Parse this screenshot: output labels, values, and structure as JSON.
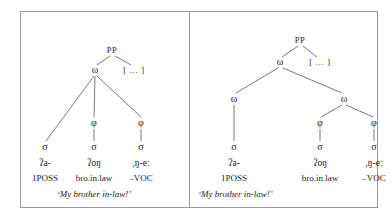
{
  "figure": {
    "caption_present": false,
    "border_color": "#9a9a9a",
    "background": "#ffffff"
  },
  "labels": {
    "pp": "PP",
    "omega": "ω",
    "phi": "φ",
    "sigma": "σ",
    "ellipsis": "[ … ]"
  },
  "panels": [
    {
      "id": "a",
      "name": "left-tree",
      "nodes": [
        {
          "name": "pp-root",
          "label": "PP",
          "x": 91,
          "y": 38
        },
        {
          "name": "omega-top",
          "label": "ω",
          "x": 74,
          "y": 58
        },
        {
          "name": "ellipsis",
          "label": "[ … ]",
          "x": 113,
          "y": 58
        },
        {
          "name": "phi-mid",
          "label": "φ",
          "x": 73,
          "y": 111
        },
        {
          "name": "phi-right",
          "label": "φ",
          "x": 120,
          "y": 111
        },
        {
          "name": "sigma-left",
          "label": "σ",
          "x": 24,
          "y": 135
        },
        {
          "name": "sigma-mid",
          "label": "σ",
          "x": 73,
          "y": 135
        },
        {
          "name": "sigma-right",
          "label": "σ",
          "x": 120,
          "y": 135
        }
      ],
      "edges": [
        {
          "name": "pp-to-omega",
          "x1": 89,
          "y1": 44,
          "x2": 76,
          "y2": 53
        },
        {
          "name": "pp-to-ellipsis",
          "x1": 94,
          "y1": 44,
          "x2": 110,
          "y2": 53
        },
        {
          "name": "omega-to-sigma-left",
          "x1": 73,
          "y1": 64,
          "x2": 25,
          "y2": 129
        },
        {
          "name": "omega-to-phi-mid",
          "x1": 74,
          "y1": 64,
          "x2": 73,
          "y2": 105
        },
        {
          "name": "omega-to-phi-right",
          "x1": 76,
          "y1": 64,
          "x2": 120,
          "y2": 105
        },
        {
          "name": "phi-mid-to-sigma",
          "x1": 73,
          "y1": 117,
          "x2": 73,
          "y2": 129
        },
        {
          "name": "phi-right-to-sigma",
          "x1": 120,
          "y1": 117,
          "x2": 120,
          "y2": 129
        }
      ],
      "glosses": [
        {
          "name": "gloss-column-1",
          "x": 24,
          "form": "ʔa-",
          "gloss": "1POSS"
        },
        {
          "name": "gloss-column-2",
          "x": 73,
          "form": "ʔoŋ",
          "gloss": "bro.in.law"
        },
        {
          "name": "gloss-column-3",
          "x": 120,
          "form": ",ŋ-eː",
          "gloss": "–VOC"
        }
      ],
      "gloss_rows": {
        "form_y": 147,
        "gloss_y": 162
      },
      "translation": {
        "name": "translation-left",
        "text": "‘My brother in-law!’",
        "x": 73,
        "y": 178,
        "align": "center"
      }
    },
    {
      "id": "b",
      "name": "right-tree",
      "nodes": [
        {
          "name": "pp-root",
          "label": "PP",
          "x": 110,
          "y": 28
        },
        {
          "name": "omega-top",
          "label": "ω",
          "x": 90,
          "y": 50
        },
        {
          "name": "ellipsis",
          "label": "[ … ]",
          "x": 130,
          "y": 50
        },
        {
          "name": "omega-left",
          "label": "ω",
          "x": 44,
          "y": 87
        },
        {
          "name": "omega-right",
          "label": "ω",
          "x": 154,
          "y": 87
        },
        {
          "name": "phi-left",
          "label": "φ",
          "x": 130,
          "y": 111
        },
        {
          "name": "phi-right",
          "label": "φ",
          "x": 184,
          "y": 111
        },
        {
          "name": "sigma-left",
          "label": "σ",
          "x": 44,
          "y": 135
        },
        {
          "name": "sigma-mid",
          "label": "σ",
          "x": 130,
          "y": 135
        },
        {
          "name": "sigma-right",
          "label": "σ",
          "x": 184,
          "y": 135
        }
      ],
      "edges": [
        {
          "name": "pp-to-omega",
          "x1": 108,
          "y1": 34,
          "x2": 92,
          "y2": 45
        },
        {
          "name": "pp-to-ellipsis",
          "x1": 113,
          "y1": 34,
          "x2": 127,
          "y2": 45
        },
        {
          "name": "omega-to-omega-left",
          "x1": 88,
          "y1": 56,
          "x2": 46,
          "y2": 81
        },
        {
          "name": "omega-to-omega-right",
          "x1": 93,
          "y1": 56,
          "x2": 152,
          "y2": 81
        },
        {
          "name": "omega-left-to-sigma",
          "x1": 44,
          "y1": 93,
          "x2": 44,
          "y2": 129
        },
        {
          "name": "omega-right-to-phi-left",
          "x1": 152,
          "y1": 93,
          "x2": 131,
          "y2": 105
        },
        {
          "name": "omega-right-to-phi-right",
          "x1": 156,
          "y1": 93,
          "x2": 183,
          "y2": 105
        },
        {
          "name": "phi-left-to-sigma",
          "x1": 130,
          "y1": 117,
          "x2": 130,
          "y2": 129
        },
        {
          "name": "phi-right-to-sigma",
          "x1": 184,
          "y1": 117,
          "x2": 184,
          "y2": 129
        }
      ],
      "glosses": [
        {
          "name": "gloss-column-1",
          "x": 44,
          "form": "ʔa-",
          "gloss": "1POSS"
        },
        {
          "name": "gloss-column-2",
          "x": 130,
          "form": "ʔoŋ",
          "gloss": "bro.in.law"
        },
        {
          "name": "gloss-column-3",
          "x": 184,
          "form": ",ŋ-eː",
          "gloss": "–VOC"
        }
      ],
      "gloss_rows": {
        "form_y": 147,
        "gloss_y": 162
      },
      "translation": {
        "name": "translation-right",
        "text": "‘My brother in-law!’",
        "x": 8,
        "y": 178,
        "align": "left"
      }
    }
  ]
}
